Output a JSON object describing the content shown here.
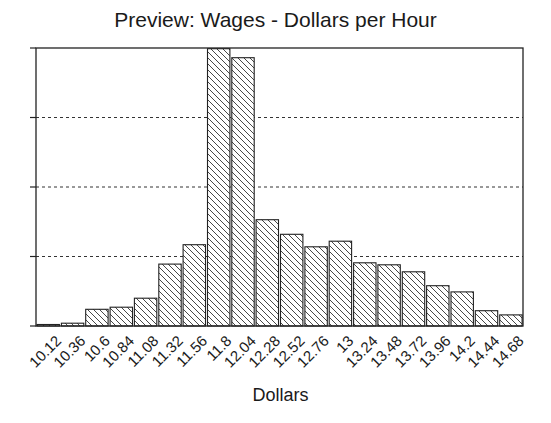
{
  "chart_data": {
    "type": "bar",
    "title": "Preview: Wages - Dollars per Hour",
    "xlabel": "Dollars",
    "ylabel": "",
    "categories": [
      "10.12",
      "10.36",
      "10.6",
      "10.84",
      "11.08",
      "11.32",
      "11.56",
      "11.8",
      "12.04",
      "12.28",
      "12.52",
      "12.76",
      "13",
      "13.24",
      "13.48",
      "13.72",
      "13.96",
      "14.2",
      "14.44",
      "14.68"
    ],
    "values": [
      0.02,
      0.04,
      0.24,
      0.27,
      0.4,
      0.89,
      1.17,
      3.99,
      3.86,
      1.53,
      1.32,
      1.14,
      1.22,
      0.91,
      0.88,
      0.78,
      0.58,
      0.49,
      0.22,
      0.16
    ],
    "value_units": "relative (1 unit = one gridline interval; y tick labels not shown)",
    "ylim": [
      0,
      4
    ],
    "yticks": [
      0,
      1,
      2,
      3,
      4
    ],
    "ytick_labels_visible": false,
    "grid": "horizontal dotted",
    "legend": null,
    "bar_fill": "diagonal hatch",
    "bar_edge_color": "#222222",
    "background": "#ffffff"
  }
}
